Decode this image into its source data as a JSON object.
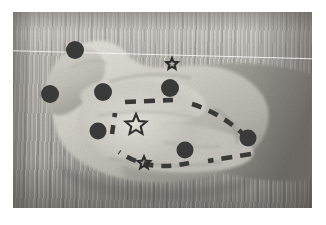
{
  "image": {
    "kind": "photograph",
    "subject": "human hand resting palm-up on a wooden table",
    "color_mode": "grayscale",
    "plate": {
      "x": 13,
      "y": 12,
      "width": 299,
      "height": 196
    },
    "page_background": "#ffffff",
    "plate_background": "#a9a6a0",
    "caption": ""
  },
  "annotation": {
    "dot_color": "#3b3b3b",
    "line_color": "#3a3a3a",
    "star_color": "#2e2e2e",
    "dot_radius": 8.5,
    "line_style": "dashed",
    "dash_pattern": "9 7",
    "landmark_dots": [
      {
        "id": "dot-1",
        "label": "thumb-tip",
        "x": 75,
        "y": 50,
        "r": 9.0
      },
      {
        "id": "dot-2",
        "label": "thumb-base",
        "x": 50,
        "y": 94,
        "r": 9.0
      },
      {
        "id": "dot-3",
        "label": "index-knuckle",
        "x": 103,
        "y": 92,
        "r": 9.0
      },
      {
        "id": "dot-4",
        "label": "middle-knuckle",
        "x": 170,
        "y": 88,
        "r": 9.0
      },
      {
        "id": "dot-5",
        "label": "palm-lower-left",
        "x": 98,
        "y": 131,
        "r": 8.5
      },
      {
        "id": "dot-6",
        "label": "palm-lower-center",
        "x": 185,
        "y": 150,
        "r": 8.5
      },
      {
        "id": "dot-7",
        "label": "palm-right",
        "x": 248,
        "y": 138,
        "r": 8.5
      }
    ],
    "stars": [
      {
        "id": "star-1",
        "label": "upper-marker",
        "x": 172,
        "y": 64,
        "r": 6.0
      },
      {
        "id": "star-2",
        "label": "center-marker",
        "x": 136,
        "y": 125,
        "r": 11.0
      },
      {
        "id": "star-3",
        "label": "lower-marker",
        "x": 144,
        "y": 163,
        "r": 6.5
      }
    ],
    "connections": [
      {
        "from": "dot-3",
        "to": "dot-4"
      },
      {
        "from": "dot-4",
        "to": "dot-7"
      },
      {
        "from": "dot-7",
        "to": "dot-6"
      },
      {
        "from": "dot-6",
        "to": "dot-5"
      },
      {
        "from": "dot-5",
        "to": "dot-3"
      }
    ]
  }
}
